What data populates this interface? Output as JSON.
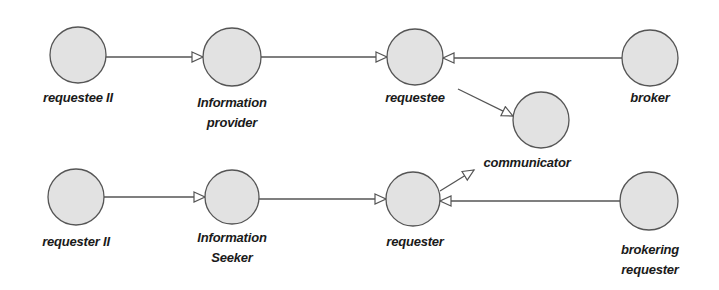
{
  "diagram": {
    "nodes": [
      {
        "id": "requestee_ii",
        "label": "requestee II",
        "cx": 78,
        "cy": 55,
        "lx": 78,
        "ly": 88
      },
      {
        "id": "information_provider",
        "label": "Information provider",
        "line1": "Information",
        "line2": "provider",
        "cx": 232,
        "cy": 57,
        "lx": 232,
        "ly": 93
      },
      {
        "id": "requestee",
        "label": "requestee",
        "cx": 415,
        "cy": 57,
        "lx": 415,
        "ly": 88
      },
      {
        "id": "communicator",
        "label": "communicator",
        "cx": 541,
        "cy": 120,
        "lx": 527,
        "ly": 153
      },
      {
        "id": "broker",
        "label": "broker",
        "cx": 650,
        "cy": 58,
        "lx": 650,
        "ly": 88
      },
      {
        "id": "requester_ii",
        "label": "requester II",
        "cx": 76,
        "cy": 197,
        "lx": 76,
        "ly": 232
      },
      {
        "id": "information_seeker",
        "label": "Information Seeker",
        "line1": "Information",
        "line2": "Seeker",
        "cx": 232,
        "cy": 197,
        "lx": 232,
        "ly": 228
      },
      {
        "id": "requester",
        "label": "requester",
        "cx": 413,
        "cy": 199,
        "lx": 415,
        "ly": 232
      },
      {
        "id": "brokering_requester",
        "label": "brokering requester",
        "line1": "brokering",
        "line2": "requester",
        "cx": 649,
        "cy": 201,
        "lx": 650,
        "ly": 240
      }
    ],
    "edges": [
      {
        "from": "requestee_ii",
        "to": "information_provider"
      },
      {
        "from": "information_provider",
        "to": "requestee"
      },
      {
        "from": "broker",
        "to": "requestee"
      },
      {
        "from": "requestee",
        "to": "communicator"
      },
      {
        "from": "requester_ii",
        "to": "information_seeker"
      },
      {
        "from": "information_seeker",
        "to": "requester"
      },
      {
        "from": "brokering_requester",
        "to": "requester"
      },
      {
        "from": "requester",
        "to": "communicator"
      }
    ],
    "colors": {
      "node_fill": "#e2e2e2",
      "node_stroke": "#555555",
      "edge": "#555555",
      "text": "#1a1a1a"
    }
  }
}
